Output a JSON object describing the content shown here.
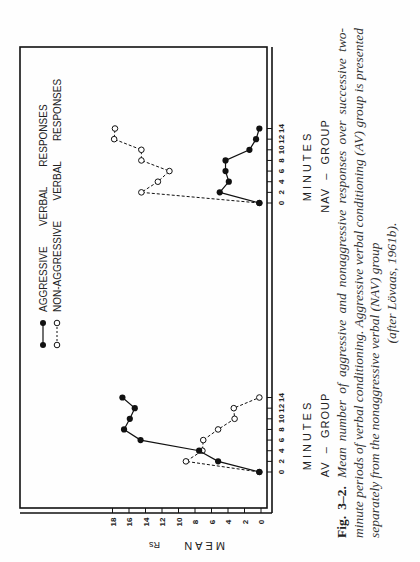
{
  "figure": {
    "label": "Fig. 3–2.",
    "caption_lines": [
      "Mean number of aggressive and nonaggressive responses over successive",
      "two-minute periods of verbal conditioning. Aggressive verbal conditioning (AV)",
      "group is presented separately from the nonaggressive verbal (NAV) group",
      "(after Lövaas, 1961b)."
    ]
  },
  "legend": {
    "aggressive": "AGGRESSIVE   VERBAL   RESPONSES",
    "nonaggressive": "NON-AGGRESSIVE   VERBAL   RESPONSES"
  },
  "axes": {
    "y_label": "MEAN",
    "y_label_sub": "Rs",
    "x_label": "MINUTES",
    "y_ticks": [
      "0",
      "2",
      "4",
      "6",
      "8",
      "10",
      "12",
      "14",
      "16",
      "18"
    ],
    "x_ticks": [
      "0",
      "2",
      "4",
      "6",
      "8",
      "10",
      "12",
      "14"
    ]
  },
  "groups": {
    "av": "AV  –  GROUP",
    "nav": "NAV  –  GROUP"
  },
  "chart_data": [
    {
      "type": "line",
      "title": "AV – GROUP",
      "xlabel": "MINUTES",
      "ylabel": "MEAN Rs",
      "x": [
        0,
        2,
        4,
        6,
        8,
        10,
        12,
        14
      ],
      "ylim": [
        0,
        18
      ],
      "grid": false,
      "legend_position": "top",
      "series": [
        {
          "name": "AGGRESSIVE VERBAL RESPONSES",
          "marker": "filled-circle",
          "line": "solid",
          "values": [
            0.2,
            5.2,
            7.5,
            14.6,
            16.6,
            15.9,
            15.3,
            16.8
          ]
        },
        {
          "name": "NON-AGGRESSIVE VERBAL RESPONSES",
          "marker": "open-circle",
          "line": "dashed",
          "values": [
            0.2,
            9.1,
            7.1,
            7.0,
            5.2,
            3.2,
            3.3,
            0.2
          ]
        }
      ]
    },
    {
      "type": "line",
      "title": "NAV – GROUP",
      "xlabel": "MINUTES",
      "ylabel": "MEAN Rs",
      "x": [
        0,
        2,
        4,
        6,
        8,
        10,
        12,
        14
      ],
      "ylim": [
        0,
        18
      ],
      "grid": false,
      "legend_position": "top",
      "series": [
        {
          "name": "AGGRESSIVE VERBAL RESPONSES",
          "marker": "filled-circle",
          "line": "solid",
          "values": [
            0.2,
            5.0,
            3.9,
            4.3,
            4.3,
            1.4,
            0.6,
            0.2
          ]
        },
        {
          "name": "NON-AGGRESSIVE VERBAL RESPONSES",
          "marker": "open-circle",
          "line": "dashed",
          "values": [
            0.2,
            14.5,
            12.5,
            11.1,
            14.5,
            14.5,
            17.8,
            17.7
          ]
        }
      ]
    }
  ]
}
